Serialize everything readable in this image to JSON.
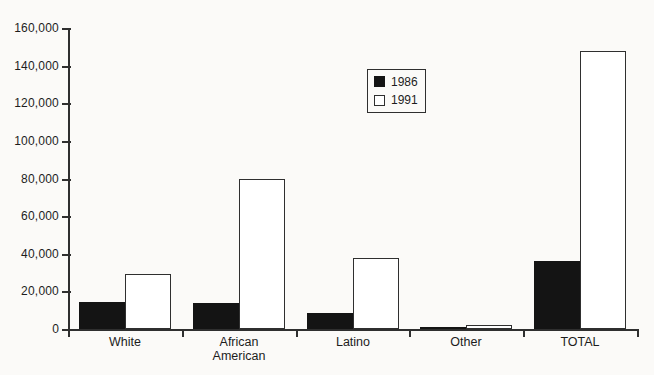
{
  "figure": {
    "background_color": "#fbfaf8",
    "axis_color": "#2f2f2f",
    "text_color": "#1d1d1d"
  },
  "legend": {
    "items": [
      {
        "label": "1986",
        "swatch": "filled-black-square"
      },
      {
        "label": "1991",
        "swatch": "open-white-square"
      }
    ]
  },
  "chart_data": {
    "type": "bar",
    "title": "",
    "xlabel": "",
    "ylabel": "",
    "categories": [
      "White",
      "African American",
      "Latino",
      "Other",
      "TOTAL"
    ],
    "series": [
      {
        "name": "1986",
        "fill": "#141414",
        "style": "solid",
        "values": [
          14500,
          14000,
          8500,
          1000,
          36000
        ]
      },
      {
        "name": "1991",
        "fill": "#ffffff",
        "style": "outlined",
        "values": [
          29500,
          80000,
          38000,
          2000,
          148000
        ]
      }
    ],
    "ylim": [
      0,
      160000
    ],
    "ytick_step": 20000,
    "ytick_labels": [
      "0",
      "20,000",
      "40,000",
      "60,000",
      "80,000",
      "100,000",
      "120,000",
      "140,000",
      "160,000"
    ],
    "grid": false,
    "legend_position": "upper-center"
  }
}
